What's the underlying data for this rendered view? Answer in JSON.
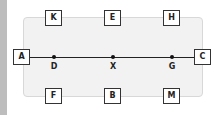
{
  "diagram": {
    "top_boxes": [
      {
        "label": "K"
      },
      {
        "label": "E"
      },
      {
        "label": "H"
      }
    ],
    "side_boxes": {
      "left": {
        "label": "A"
      },
      "right": {
        "label": "C"
      }
    },
    "line_points": [
      {
        "label": "D"
      },
      {
        "label": "X"
      },
      {
        "label": "G"
      }
    ],
    "bottom_boxes": [
      {
        "label": "F"
      },
      {
        "label": "B"
      },
      {
        "label": "M"
      }
    ]
  },
  "colors": {
    "panel_fill": "#f2f2f2",
    "box_border": "#333333",
    "line": "#222222",
    "left_strip": "#bdbdbd"
  }
}
